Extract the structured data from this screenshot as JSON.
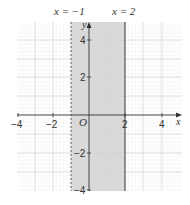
{
  "title_labels": {
    "left_line": "x = −1",
    "right_line": "x = 2"
  },
  "axes": {
    "x_label": "x",
    "y_label": "y",
    "origin_label": "O",
    "x_ticks": [
      "−4",
      "−2",
      "2",
      "4"
    ],
    "y_ticks": [
      "4",
      "2",
      "−2",
      "−4"
    ],
    "x_range": [
      -4,
      5
    ],
    "y_range": [
      -4,
      5
    ]
  },
  "region": {
    "x_min": -1,
    "x_max": 2,
    "left_boundary": "dashed",
    "right_boundary": "solid",
    "fill_color": "#d4d4d4"
  },
  "colors": {
    "grid_minor": "#e4e4e4",
    "grid_major": "#cccccc",
    "axis": "#333333",
    "boundary": "#555555"
  }
}
